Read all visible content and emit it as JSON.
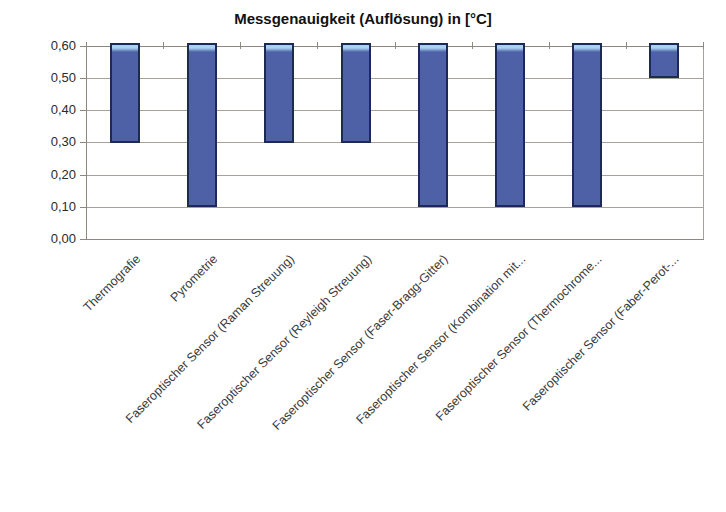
{
  "chart_data": {
    "type": "bar",
    "subtype": "floating-range-columns",
    "title": "Messgenauigkeit (Auflösung) in [°C]",
    "categories": [
      "Thermografie",
      "Pyrometrie",
      "Faseroptischer Sensor (Raman Streuung)",
      "Faseroptischer Sensor (Reyleigh Streuung)",
      "Faseroptischer Sensor (Faser-Bragg-Gitter)",
      "Faseroptischer Sensor (Kombination mit...",
      "Faseroptischer Sensor (Thermochrome...",
      "Faseroptischer Sensor (Faber-Perot-..."
    ],
    "series": [
      {
        "name": "Messgenauigkeit (Auflösung)",
        "ranges": [
          {
            "min": 0.3,
            "max": 0.6
          },
          {
            "min": 0.1,
            "max": 0.6
          },
          {
            "min": 0.3,
            "max": 0.6
          },
          {
            "min": 0.3,
            "max": 0.6
          },
          {
            "min": 0.1,
            "max": 0.6
          },
          {
            "min": 0.1,
            "max": 0.6
          },
          {
            "min": 0.1,
            "max": 0.6
          },
          {
            "min": 0.5,
            "max": 0.6
          }
        ]
      }
    ],
    "xlabel": "",
    "ylabel": "",
    "ylim": [
      0.0,
      0.6
    ],
    "ytick_step": 0.1,
    "ytick_labels": [
      "0,00",
      "0,10",
      "0,20",
      "0,30",
      "0,40",
      "0,50",
      "0,60"
    ],
    "grid": true,
    "legend": "none",
    "category_label_rotation_deg": 45,
    "decimal_separator": ",",
    "colors": {
      "bar_fill": "#4e61a6",
      "bar_border": "#1c2a55",
      "bar_top_highlight": "#a9d2f2",
      "gridline": "#a6a19a",
      "axis_line": "#8c8880",
      "title_text": "#111111",
      "tick_text": "#2b2b2b",
      "category_text": "#3a3a3a",
      "background": "#ffffff"
    }
  }
}
